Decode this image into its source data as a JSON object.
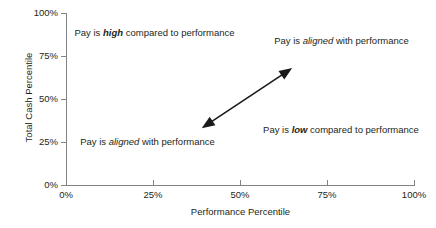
{
  "chart_data": {
    "type": "scatter",
    "title": "",
    "xlabel": "Performance Percentile",
    "ylabel": "Total Cash Percentile",
    "xlim": [
      0,
      100
    ],
    "ylim": [
      0,
      100
    ],
    "grid": false,
    "legend": null,
    "x_ticks": [
      "0%",
      "25%",
      "50%",
      "75%",
      "100%"
    ],
    "y_ticks": [
      "0%",
      "25%",
      "50%",
      "75%",
      "100%"
    ],
    "x_tick_values": [
      0,
      25,
      50,
      75,
      100
    ],
    "y_tick_values": [
      0,
      25,
      50,
      75,
      100
    ],
    "series": [],
    "annotations": [
      {
        "name": "quadrant-top-left",
        "text_parts": [
          {
            "text": "Pay is ",
            "style": "normal"
          },
          {
            "text": "high",
            "style": "bold-italic"
          },
          {
            "text": " compared to performance",
            "style": "normal"
          }
        ],
        "plain_text": "Pay is high compared to performance",
        "x_range": [
          5,
          45
        ],
        "y_range": [
          75,
          100
        ]
      },
      {
        "name": "quadrant-top-right",
        "text_parts": [
          {
            "text": "Pay is ",
            "style": "normal"
          },
          {
            "text": "aligned",
            "style": "italic"
          },
          {
            "text": " with performance",
            "style": "normal"
          }
        ],
        "plain_text": "Pay is aligned with performance",
        "x_range": [
          55,
          100
        ],
        "y_range": [
          75,
          100
        ]
      },
      {
        "name": "quadrant-bottom-left",
        "text_parts": [
          {
            "text": "Pay is ",
            "style": "normal"
          },
          {
            "text": "aligned",
            "style": "italic"
          },
          {
            "text": " with performance",
            "style": "normal"
          }
        ],
        "plain_text": "Pay is aligned with performance",
        "x_range": [
          0,
          45
        ],
        "y_range": [
          22,
          32
        ]
      },
      {
        "name": "quadrant-bottom-right",
        "text_parts": [
          {
            "text": "Pay is ",
            "style": "normal"
          },
          {
            "text": "low",
            "style": "bold-italic"
          },
          {
            "text": " compared to performance",
            "style": "normal"
          }
        ],
        "plain_text": "Pay is low compared to performance",
        "x_range": [
          55,
          100
        ],
        "y_range": [
          20,
          38
        ]
      }
    ],
    "arrow": {
      "type": "double-headed",
      "from": {
        "x": 39,
        "y": 33
      },
      "to": {
        "x": 65,
        "y": 68
      },
      "color": "#1a1a1a",
      "description": "double-headed diagonal arrow along the alignment diagonal"
    },
    "colors": {
      "axis": "#808285",
      "text": "#231f20",
      "arrow": "#1a1a1a",
      "background": "#ffffff"
    }
  },
  "axes": {
    "y_title": "Total Cash Percentile",
    "x_title": "Performance Percentile",
    "y_ticks": [
      {
        "label": "100%",
        "top": 8
      },
      {
        "label": "75%",
        "top": 51
      },
      {
        "label": "50%",
        "top": 94
      },
      {
        "label": "25%",
        "top": 137
      },
      {
        "label": "0%",
        "top": 180
      }
    ],
    "x_ticks": [
      {
        "label": "0%",
        "left": 66
      },
      {
        "label": "25%",
        "left": 153
      },
      {
        "label": "50%",
        "left": 240
      },
      {
        "label": "75%",
        "left": 327
      },
      {
        "label": "100%",
        "left": 414
      }
    ]
  },
  "quadrants": {
    "top_left": {
      "pre": "Pay is ",
      "emph": "high",
      "post": " compared to performance"
    },
    "top_right": {
      "pre": "Pay is ",
      "emph": "aligned",
      "post": " with performance"
    },
    "bottom_left": {
      "pre": "Pay is ",
      "emph": "aligned",
      "post": " with performance"
    },
    "bottom_right": {
      "pre": "Pay is ",
      "emph": "low",
      "post": " compared to performance"
    }
  }
}
